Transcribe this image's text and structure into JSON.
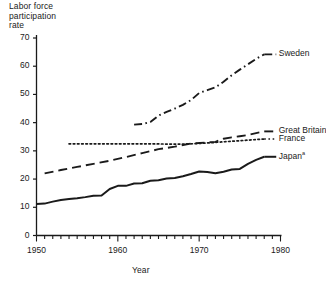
{
  "chart_data": {
    "type": "line",
    "title": "",
    "ylabel": "Labor force\nparticipation\nrate",
    "xlabel": "Year",
    "xlim": [
      1950,
      1980
    ],
    "ylim": [
      0,
      70
    ],
    "grid": false,
    "legend_position": "right-of-line-ends",
    "x_ticks": [
      1950,
      1960,
      1970,
      1980
    ],
    "x_tick_labels": [
      "1950",
      "1960",
      "1970",
      "1980"
    ],
    "x_minor_tick_interval": 1,
    "y_ticks": [
      0,
      10,
      20,
      30,
      40,
      50,
      60,
      70
    ],
    "y_tick_labels": [
      "0",
      "10",
      "20",
      "30",
      "40",
      "50",
      "60",
      "70"
    ],
    "series": [
      {
        "name": "Sweden",
        "label": "Sweden",
        "style": "dash-dot",
        "x": [
          1962,
          1963,
          1964,
          1965,
          1966,
          1967,
          1968,
          1969,
          1970,
          1971,
          1972,
          1973,
          1974,
          1975,
          1976,
          1977,
          1978
        ],
        "values": [
          39.3,
          39.5,
          40.2,
          42.5,
          43.8,
          45.0,
          46.3,
          48.0,
          50.5,
          51.5,
          52.5,
          54.5,
          56.8,
          58.8,
          60.7,
          62.6,
          64.2
        ]
      },
      {
        "name": "Great Britain",
        "label": "Great Britain",
        "style": "dashed",
        "x": [
          1951,
          1953,
          1955,
          1957,
          1959,
          1961,
          1963,
          1965,
          1967,
          1969,
          1971,
          1972,
          1973,
          1974,
          1975,
          1976,
          1977,
          1978
        ],
        "values": [
          22.0,
          23.2,
          24.3,
          25.4,
          26.5,
          27.8,
          29.2,
          30.6,
          31.5,
          32.6,
          33.0,
          33.2,
          34.3,
          34.8,
          35.2,
          35.6,
          36.3,
          36.9
        ]
      },
      {
        "name": "France",
        "label": "France",
        "style": "dotted",
        "x": [
          1954,
          1956,
          1958,
          1960,
          1962,
          1964,
          1966,
          1968,
          1970,
          1972,
          1974,
          1976,
          1978
        ],
        "values": [
          32.5,
          32.5,
          32.5,
          32.5,
          32.5,
          32.5,
          32.4,
          32.4,
          32.6,
          33.0,
          33.4,
          33.8,
          34.2
        ]
      },
      {
        "name": "Japan",
        "label": "Japan",
        "label_superscript": "a",
        "style": "solid",
        "x": [
          1950,
          1951,
          1952,
          1953,
          1954,
          1955,
          1956,
          1957,
          1958,
          1959,
          1960,
          1961,
          1962,
          1963,
          1964,
          1965,
          1966,
          1967,
          1968,
          1969,
          1970,
          1971,
          1972,
          1973,
          1974,
          1975,
          1976,
          1977,
          1978
        ],
        "values": [
          11.2,
          11.3,
          12.0,
          12.6,
          12.9,
          13.2,
          13.6,
          14.1,
          14.2,
          16.5,
          17.6,
          17.6,
          18.4,
          18.5,
          19.4,
          19.6,
          20.2,
          20.4,
          21.0,
          21.8,
          22.7,
          22.5,
          22.1,
          22.6,
          23.4,
          23.6,
          25.4,
          26.8,
          27.9
        ]
      }
    ]
  },
  "colors": {
    "ink": "#1a1a1a",
    "background": "#ffffff"
  }
}
